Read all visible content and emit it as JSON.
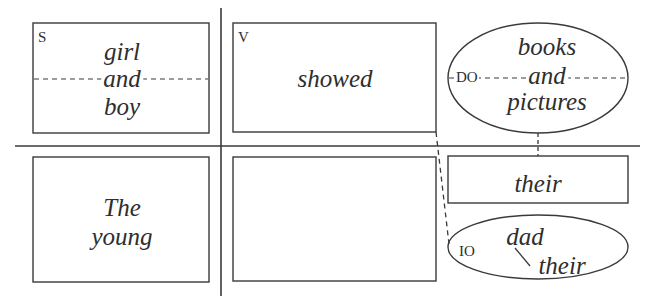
{
  "diagram": {
    "type": "sentence-diagram",
    "sentence_parts": {
      "subject": {
        "label": "S",
        "words": [
          "girl",
          "and",
          "boy"
        ],
        "modifiers": [
          "The",
          "young"
        ]
      },
      "verb": {
        "label": "V",
        "word": "showed"
      },
      "direct_object": {
        "label": "DO",
        "words": [
          "books",
          "and",
          "pictures"
        ],
        "modifier": "their"
      },
      "indirect_object": {
        "label": "IO",
        "word": "dad",
        "modifier": "their"
      }
    },
    "colors": {
      "line": "#3a3a3a",
      "text": "#2e2e2e",
      "background": "#ffffff"
    }
  }
}
